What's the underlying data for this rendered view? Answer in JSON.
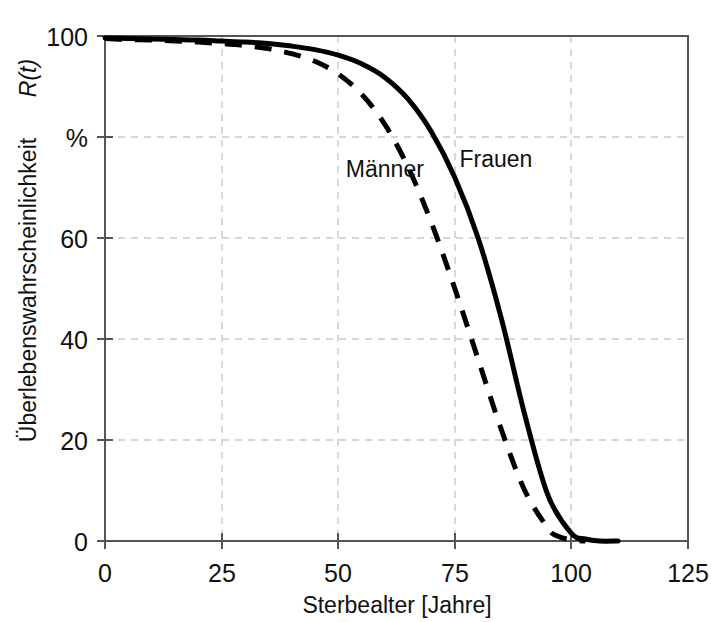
{
  "chart_data": {
    "type": "line",
    "title": "",
    "subtitle": "",
    "xlabel": "Sterbealter [Jahre]",
    "ylabel": "Überlebenswahrscheinlichkeit R(t)",
    "ylabel_plain": "Überlebenswahrscheinlichkeit ",
    "ylabel_italic": "R(t)",
    "yunit": "%",
    "xlim": [
      0,
      125
    ],
    "ylim": [
      0,
      100
    ],
    "xticks": [
      0,
      25,
      50,
      75,
      100,
      125
    ],
    "xtick_labels": [
      "0",
      "25",
      "50",
      "75",
      "100",
      "125"
    ],
    "yticks": [
      0,
      20,
      40,
      60,
      80,
      100
    ],
    "ytick_labels": [
      "0",
      "20",
      "40",
      "60",
      "%",
      "100"
    ],
    "grid": "dashed light gray, both axes, interior only",
    "legend_position": "inline annotations on curves",
    "series": [
      {
        "name": "Männer",
        "style": "dashed",
        "color": "#000000",
        "label_x": 60,
        "label_y": 72,
        "x": [
          0,
          5,
          10,
          15,
          20,
          25,
          30,
          35,
          40,
          45,
          50,
          55,
          60,
          65,
          70,
          75,
          80,
          85,
          90,
          95,
          97,
          100,
          103
        ],
        "y": [
          99.5,
          99.3,
          99.2,
          99.0,
          98.8,
          98.5,
          98.1,
          97.5,
          96.5,
          95.0,
          92.5,
          88.5,
          82.5,
          74.0,
          63.0,
          50.0,
          36.0,
          22.0,
          10.0,
          2.5,
          1.0,
          0.2,
          0.0
        ]
      },
      {
        "name": "Frauen",
        "style": "solid",
        "color": "#000000",
        "label_x": 76,
        "label_y": 74,
        "x": [
          0,
          5,
          10,
          15,
          20,
          25,
          30,
          35,
          40,
          45,
          50,
          55,
          60,
          65,
          70,
          75,
          80,
          85,
          90,
          95,
          100,
          103,
          106,
          110
        ],
        "y": [
          99.6,
          99.5,
          99.4,
          99.3,
          99.2,
          99.0,
          98.8,
          98.5,
          98.0,
          97.3,
          96.2,
          94.5,
          91.8,
          87.5,
          81.0,
          72.0,
          60.0,
          44.0,
          25.0,
          9.0,
          1.5,
          0.4,
          0.0,
          0.0
        ]
      }
    ]
  },
  "axis": {
    "y_title_plain": "Überlebenswahrscheinlichkeit ",
    "y_title_italic": "R(t)",
    "x_title": "Sterbealter [Jahre]"
  }
}
